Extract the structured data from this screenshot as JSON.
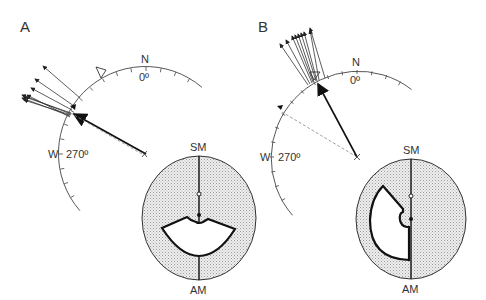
{
  "panels": [
    {
      "id": "A",
      "label": "A",
      "compass": {
        "north_label": "N",
        "north_degree": "0º",
        "west_label": "W",
        "west_degree": "270º"
      },
      "mirror_labels": {
        "top": "SM",
        "bottom": "AM"
      }
    },
    {
      "id": "B",
      "label": "B",
      "compass": {
        "north_label": "N",
        "north_degree": "0º",
        "west_label": "W",
        "west_degree": "270º"
      },
      "mirror_labels": {
        "top": "SM",
        "bottom": "AM"
      }
    }
  ],
  "colors": {
    "ink": "#222222",
    "stipple": "#d8d8d8",
    "dashed": "#888888"
  }
}
